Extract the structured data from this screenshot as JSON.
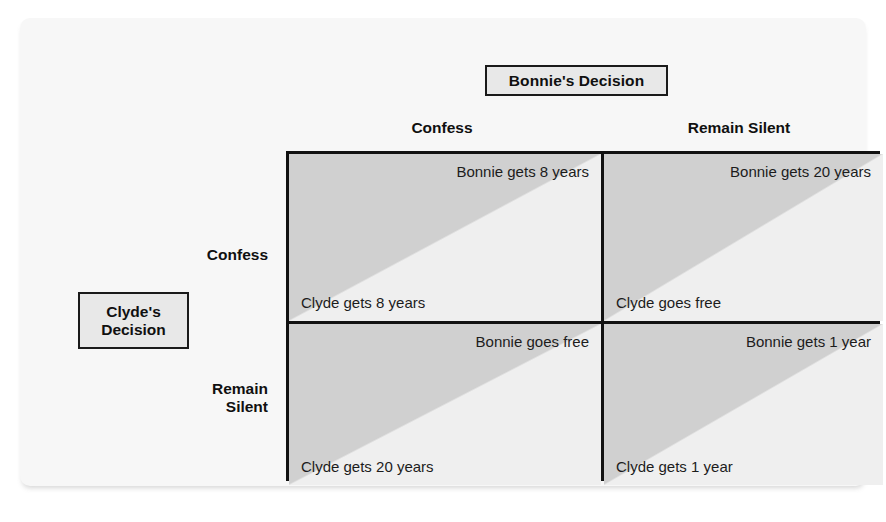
{
  "figure": {
    "column_header": "Bonnie's Decision",
    "row_header_line1": "Clyde's",
    "row_header_line2": "Decision",
    "column_labels": [
      "Confess",
      "Remain Silent"
    ],
    "row_labels": [
      {
        "line1": "Confess",
        "line2": ""
      },
      {
        "line1": "Remain",
        "line2": "Silent"
      }
    ],
    "colors": {
      "panel_background": "#f7f7f7",
      "header_box_fill": "#e8e8e8",
      "border": "#111111",
      "cell_upper_triangle": "#d0d0d0",
      "cell_lower_triangle": "#efefef",
      "text": "#1c1c1c"
    }
  },
  "chart_data": {
    "type": "table",
    "xlabel": "Bonnie's Decision",
    "ylabel": "Clyde's Decision",
    "categories": [
      "Confess",
      "Remain Silent"
    ],
    "row_categories": [
      "Confess",
      "Remain Silent"
    ],
    "cells": [
      {
        "row": "Confess",
        "column": "Confess",
        "bonnie_payoff": "Bonnie gets 8 years",
        "clyde_payoff": "Clyde gets 8 years",
        "bonnie_years": 8,
        "clyde_years": 8
      },
      {
        "row": "Confess",
        "column": "Remain Silent",
        "bonnie_payoff": "Bonnie gets 20 years",
        "clyde_payoff": "Clyde goes free",
        "bonnie_years": 20,
        "clyde_years": 0
      },
      {
        "row": "Remain Silent",
        "column": "Confess",
        "bonnie_payoff": "Bonnie goes free",
        "clyde_payoff": "Clyde gets 20 years",
        "bonnie_years": 0,
        "clyde_years": 20
      },
      {
        "row": "Remain Silent",
        "column": "Remain Silent",
        "bonnie_payoff": "Bonnie gets 1 year",
        "clyde_payoff": "Clyde gets 1 year",
        "bonnie_years": 1,
        "clyde_years": 1
      }
    ]
  }
}
